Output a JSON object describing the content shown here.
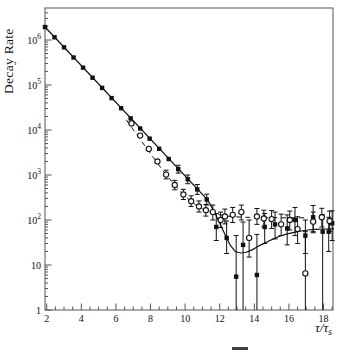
{
  "figure": {
    "ylabel": "Decay Rate",
    "xlabel_main": "τ/τ",
    "xlabel_sub": "s"
  },
  "chart_data": {
    "type": "scatter",
    "title": "",
    "ylabel": "Decay Rate",
    "xlabel": "tau/tau_s",
    "y_scale": "log",
    "x_range": [
      1.9,
      18.55
    ],
    "y_range": [
      1,
      4640000
    ],
    "grid": false,
    "legend": "none",
    "x_major_ticks": [
      2,
      4,
      6,
      8,
      10,
      12,
      14,
      16,
      18
    ],
    "x_minor_step": 0.5,
    "y_ticks": [
      {
        "v": 1000000,
        "mant": "10",
        "exp": "6"
      },
      {
        "v": 100000,
        "mant": "10",
        "exp": "5"
      },
      {
        "v": 10000,
        "mant": "10",
        "exp": "4"
      },
      {
        "v": 1000,
        "mant": "10",
        "exp": "3"
      },
      {
        "v": 100,
        "mant": "10",
        "exp": "2"
      },
      {
        "v": 10,
        "mant": "10",
        "exp": ""
      },
      {
        "v": 1,
        "mant": "1",
        "exp": ""
      }
    ],
    "axis_map": {
      "x0_px": 45,
      "x0_val": 1.9,
      "px_per_unit": 17.3,
      "y_base_px": 310,
      "px_per_decade": 45,
      "box": {
        "l": 45,
        "t": 8,
        "r": 333,
        "b": 310
      }
    },
    "colors": {
      "data": "#111111",
      "box": "#555555",
      "marker_fill": "#ffffff"
    },
    "series": [
      {
        "name": "decay-filled-squares",
        "marker": "filled-square",
        "points": [
          [
            1.9,
            1940000
          ],
          [
            2.45,
            1150000
          ],
          [
            3.0,
            687000
          ],
          [
            3.55,
            408000
          ],
          [
            4.1,
            243000
          ],
          [
            4.65,
            145000
          ],
          [
            5.2,
            86100
          ],
          [
            5.75,
            51200
          ],
          [
            6.3,
            30500
          ],
          [
            6.85,
            18100
          ],
          [
            7.4,
            10800
          ],
          [
            7.95,
            6410
          ],
          [
            8.5,
            3820
          ],
          [
            9.05,
            2270
          ],
          [
            9.6,
            1350,
            1100,
            1650
          ],
          [
            10.15,
            804,
            640,
            1000
          ],
          [
            10.7,
            478,
            370,
            615
          ],
          [
            11.25,
            285,
            215,
            375
          ],
          [
            11.8,
            70,
            35,
            140
          ],
          [
            12.4,
            40,
            18,
            95
          ],
          [
            12.95,
            5.5,
            0.8,
            45
          ],
          [
            13.35,
            28,
            0.8,
            90
          ],
          [
            14.15,
            6,
            0.8,
            48
          ],
          [
            14.6,
            70,
            30,
            140
          ],
          [
            15.2,
            80,
            38,
            150
          ],
          [
            15.9,
            65,
            28,
            130
          ],
          [
            16.35,
            100,
            45,
            190
          ],
          [
            16.95,
            45,
            18,
            100
          ],
          [
            17.4,
            115,
            55,
            210
          ],
          [
            17.95,
            55,
            0.8,
            130
          ],
          [
            18.3,
            55,
            20,
            115
          ],
          [
            18.5,
            85,
            35,
            160
          ]
        ]
      },
      {
        "name": "background-open-circles",
        "marker": "open-circle",
        "points": [
          [
            6.9,
            14000
          ],
          [
            7.4,
            7500
          ],
          [
            7.9,
            3800
          ],
          [
            8.4,
            2000
          ],
          [
            8.9,
            1020,
            820,
            1280
          ],
          [
            9.4,
            600,
            470,
            760
          ],
          [
            9.9,
            370,
            285,
            480
          ],
          [
            10.35,
            262,
            200,
            345
          ],
          [
            10.8,
            200,
            150,
            265
          ],
          [
            11.2,
            165,
            122,
            222
          ],
          [
            11.6,
            150,
            100,
            215
          ],
          [
            12.05,
            100,
            68,
            150
          ],
          [
            12.3,
            120,
            82,
            175
          ],
          [
            12.75,
            130,
            88,
            190
          ],
          [
            13.25,
            150,
            100,
            215
          ],
          [
            13.7,
            40,
            15,
            100
          ],
          [
            14.15,
            120,
            80,
            180
          ],
          [
            14.55,
            108,
            70,
            165
          ],
          [
            15.0,
            105,
            65,
            162
          ],
          [
            15.55,
            80,
            45,
            135
          ],
          [
            16.05,
            100,
            60,
            158
          ],
          [
            16.5,
            63,
            30,
            118
          ],
          [
            16.95,
            6.5,
            0.8,
            55
          ],
          [
            17.4,
            92,
            52,
            150
          ],
          [
            17.9,
            115,
            70,
            182
          ],
          [
            18.35,
            95,
            55,
            158
          ]
        ]
      }
    ],
    "fits": [
      {
        "name": "signal-fit-solid-line",
        "style": "solid",
        "points": [
          [
            1.85,
            2050000
          ],
          [
            11.3,
            280
          ],
          [
            11.7,
            150
          ],
          [
            12.0,
            85
          ],
          [
            12.3,
            48
          ],
          [
            12.6,
            28
          ],
          [
            12.9,
            20
          ],
          [
            13.2,
            18.5
          ],
          [
            13.5,
            19
          ],
          [
            13.9,
            22
          ],
          [
            14.3,
            27
          ],
          [
            14.7,
            32
          ],
          [
            15.1,
            38
          ],
          [
            15.5,
            44
          ],
          [
            15.9,
            49
          ],
          [
            16.3,
            53
          ],
          [
            16.7,
            57
          ],
          [
            17.1,
            60
          ],
          [
            17.5,
            62
          ],
          [
            18.0,
            63
          ],
          [
            18.6,
            63.5
          ]
        ]
      },
      {
        "name": "background-fit-dashed-line",
        "style": "dashed",
        "points": [
          [
            6.6,
            16860
          ],
          [
            7.0,
            10190
          ],
          [
            7.4,
            6190
          ],
          [
            7.8,
            3780
          ],
          [
            8.2,
            2325
          ],
          [
            8.6,
            1447
          ],
          [
            9.0,
            917
          ],
          [
            9.4,
            598
          ],
          [
            9.8,
            405
          ],
          [
            10.2,
            289
          ],
          [
            10.6,
            219
          ],
          [
            11.0,
            176
          ],
          [
            11.4,
            151
          ],
          [
            11.8,
            135
          ],
          [
            12.2,
            126
          ],
          [
            12.6,
            120
          ],
          [
            13.0,
            117
          ],
          [
            13.5,
            115
          ],
          [
            14.0,
            114
          ],
          [
            14.5,
            113
          ],
          [
            15.0,
            113
          ],
          [
            15.5,
            112
          ],
          [
            16.0,
            112
          ],
          [
            16.5,
            112
          ],
          [
            16.9,
            112
          ]
        ]
      }
    ]
  }
}
